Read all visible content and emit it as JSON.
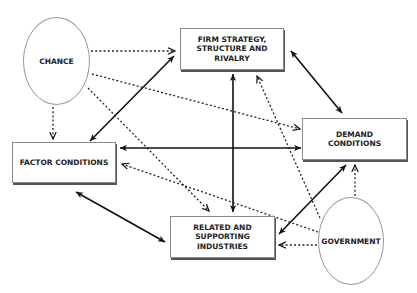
{
  "diagram": {
    "nodes": {
      "chance": {
        "label": "CHANCE",
        "shape": "ellipse"
      },
      "firm": {
        "label": "FIRM STRATEGY,\nSTRUCTURE AND\nRIVALRY",
        "shape": "box"
      },
      "demand": {
        "label": "DEMAND\nCONDITIONS",
        "shape": "box"
      },
      "factor": {
        "label": "FACTOR CONDITIONS",
        "shape": "box"
      },
      "related": {
        "label": "RELATED AND\nSUPPORTING\nINDUSTRIES",
        "shape": "box"
      },
      "government": {
        "label": "GOVERNMENT",
        "shape": "ellipse"
      }
    },
    "edges": [
      {
        "from": "factor",
        "to": "firm",
        "style": "solid",
        "direction": "both"
      },
      {
        "from": "firm",
        "to": "demand",
        "style": "solid",
        "direction": "both"
      },
      {
        "from": "factor",
        "to": "demand",
        "style": "solid",
        "direction": "both"
      },
      {
        "from": "firm",
        "to": "related",
        "style": "solid",
        "direction": "both"
      },
      {
        "from": "factor",
        "to": "related",
        "style": "solid",
        "direction": "both"
      },
      {
        "from": "related",
        "to": "demand",
        "style": "solid",
        "direction": "both"
      },
      {
        "from": "chance",
        "to": "firm",
        "style": "dotted",
        "direction": "forward"
      },
      {
        "from": "chance",
        "to": "demand",
        "style": "dotted",
        "direction": "forward"
      },
      {
        "from": "chance",
        "to": "factor",
        "style": "dotted",
        "direction": "forward"
      },
      {
        "from": "chance",
        "to": "related",
        "style": "dotted",
        "direction": "forward"
      },
      {
        "from": "government",
        "to": "firm",
        "style": "dotted",
        "direction": "forward"
      },
      {
        "from": "government",
        "to": "demand",
        "style": "dotted",
        "direction": "forward"
      },
      {
        "from": "government",
        "to": "factor",
        "style": "dotted",
        "direction": "forward"
      },
      {
        "from": "government",
        "to": "related",
        "style": "dotted",
        "direction": "forward"
      }
    ]
  }
}
